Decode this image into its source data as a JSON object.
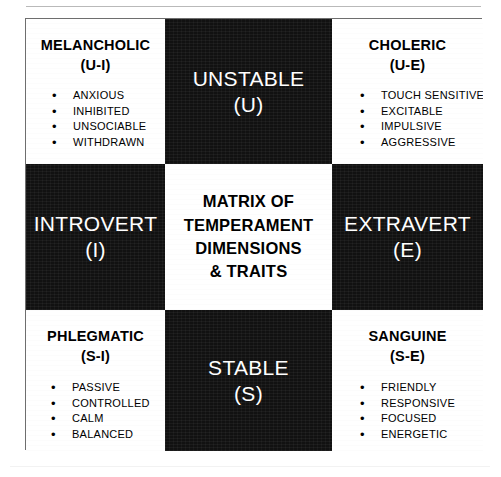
{
  "diagram": {
    "center_title_lines": [
      "MATRIX OF",
      "TEMPERAMENT",
      "DIMENSIONS",
      "& TRAITS"
    ],
    "poles": {
      "top": {
        "name": "UNSTABLE",
        "code": "(U)"
      },
      "bottom": {
        "name": "STABLE",
        "code": "(S)"
      },
      "left": {
        "name": "INTROVERT",
        "code": "(I)"
      },
      "right": {
        "name": "EXTRAVERT",
        "code": "(E)"
      }
    },
    "temperaments": {
      "melancholic": {
        "name": "MELANCHOLIC",
        "code": "(U-I)",
        "traits": [
          "ANXIOUS",
          "INHIBITED",
          "UNSOCIABLE",
          "WITHDRAWN"
        ]
      },
      "choleric": {
        "name": "CHOLERIC",
        "code": "(U-E)",
        "traits": [
          "TOUCH SENSITIVE",
          "EXCITABLE",
          "IMPULSIVE",
          "AGGRESSIVE"
        ]
      },
      "phlegmatic": {
        "name": "PHLEGMATIC",
        "code": "(S-I)",
        "traits": [
          "PASSIVE",
          "CONTROLLED",
          "CALM",
          "BALANCED"
        ]
      },
      "sanguine": {
        "name": "SANGUINE",
        "code": "(S-E)",
        "traits": [
          "FRIENDLY",
          "RESPONSIVE",
          "FOCUSED",
          "ENERGETIC"
        ]
      }
    },
    "bullet_glyph": "•",
    "colors": {
      "cell_dark": "#111111",
      "cell_light": "#ffffff",
      "frame": "#6e6e6e"
    }
  }
}
